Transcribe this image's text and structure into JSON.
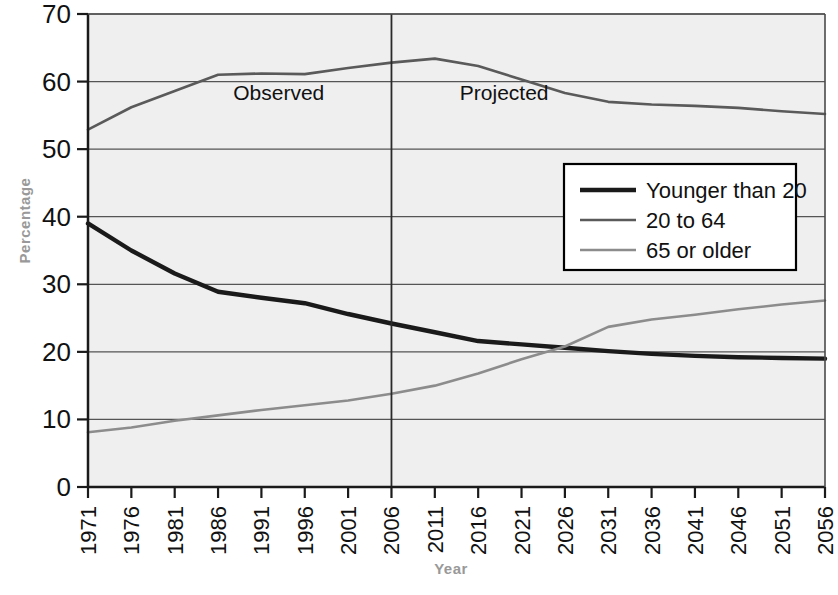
{
  "chart_data": {
    "type": "line",
    "title": "",
    "xlabel": "Year",
    "ylabel": "Percentage",
    "xlim": [
      1971,
      2056
    ],
    "ylim": [
      0,
      70
    ],
    "ytick_step": 10,
    "grid": true,
    "legend_position": "center-right",
    "categories": [
      1971,
      1976,
      1981,
      1986,
      1991,
      1996,
      2001,
      2006,
      2011,
      2016,
      2021,
      2026,
      2031,
      2036,
      2041,
      2046,
      2051,
      2056
    ],
    "tick_labels": [
      "1971",
      "1976",
      "1981",
      "1986",
      "1991",
      "1996",
      "2001",
      "2006",
      "2011",
      "2016",
      "2021",
      "2026",
      "2031",
      "2036",
      "2041",
      "2046",
      "2051",
      "2056"
    ],
    "ytick_labels": [
      "0",
      "10",
      "20",
      "30",
      "40",
      "50",
      "60",
      "70"
    ],
    "series": [
      {
        "name": "Younger than 20",
        "color": "#1a1a1a",
        "width": 4.4,
        "values": [
          39.0,
          35.0,
          31.6,
          28.9,
          28.0,
          27.2,
          25.6,
          24.2,
          22.9,
          21.6,
          21.1,
          20.6,
          20.1,
          19.7,
          19.4,
          19.2,
          19.1,
          19.0
        ]
      },
      {
        "name": "20 to 64",
        "color": "#5a5a5a",
        "width": 2.6,
        "values": [
          52.9,
          56.2,
          58.6,
          61.0,
          61.2,
          61.1,
          62.0,
          62.8,
          63.4,
          62.3,
          60.3,
          58.3,
          57.0,
          56.6,
          56.4,
          56.1,
          55.6,
          55.2
        ]
      },
      {
        "name": "65 or older",
        "color": "#8c8c8c",
        "width": 2.6,
        "values": [
          8.1,
          8.8,
          9.8,
          10.6,
          11.4,
          12.1,
          12.8,
          13.8,
          15.0,
          16.8,
          18.9,
          20.8,
          23.7,
          24.8,
          25.5,
          26.3,
          27.0,
          27.6
        ]
      }
    ],
    "annotations": [
      {
        "text": "Observed",
        "x_year": 1993,
        "y_value": 57.2
      },
      {
        "text": "Projected",
        "x_year": 2019,
        "y_value": 57.2
      }
    ],
    "divider": {
      "x_year": 2006,
      "label": "observed-projected-divider"
    }
  },
  "legend": {
    "entries": [
      "Younger than 20",
      "20 to 64",
      "65 or older"
    ]
  },
  "colors": {
    "plot_background": "#efefef",
    "grid": "#555555",
    "axis": "#1a1a1a",
    "axis_title": "#999999",
    "legend_background": "#ffffff",
    "legend_border": "#000000"
  }
}
